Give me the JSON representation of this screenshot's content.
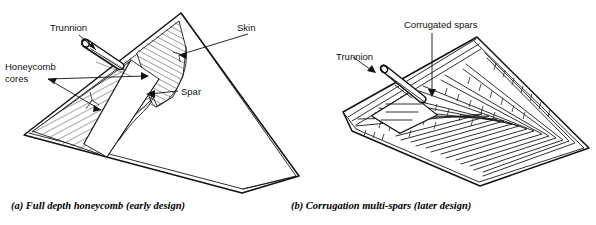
{
  "figure": {
    "background_color": "#ffffff",
    "line_color": "#111111",
    "width": 596,
    "height": 225
  },
  "panel_a": {
    "id": "a",
    "caption": "(a)  Full depth honeycomb (early design)",
    "caption_marker": "(a)",
    "caption_body": "Full depth honeycomb (early design)",
    "labels": {
      "trunnion": "Trunnion",
      "honeycomb_line1": "Honeycomb",
      "honeycomb_line2": "cores",
      "skin": "Skin",
      "spar": "Spar"
    }
  },
  "panel_b": {
    "id": "b",
    "caption": "(b)  Corrugation multi-spars (later design)",
    "caption_marker": "(b)",
    "caption_body": "Corrugation multi-spars (later design)",
    "labels": {
      "trunnion": "Trunnion",
      "corrugated_spars": "Corrugated spars"
    }
  }
}
